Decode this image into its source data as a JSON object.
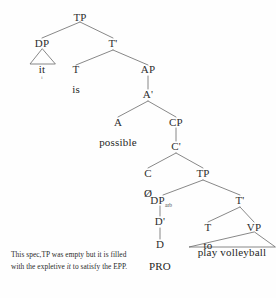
{
  "figure": {
    "type": "syntax-tree",
    "title": "",
    "line_color": "#5a5a5a",
    "text_color": "#2b2b2b",
    "background": "#fefefe"
  },
  "nodes": {
    "tp_root": "TP",
    "dp_subject": "DP",
    "t_bar_top": "T'",
    "it": "it",
    "it_subscript": "i",
    "t_head_top": "T",
    "is": "is",
    "ap": "AP",
    "a_bar": "A'",
    "a_head": "A",
    "possible": "possible",
    "cp": "CP",
    "c_bar": "C'",
    "c_head": "C",
    "null_c": "Ø",
    "tp_embedded": "TP",
    "dp_arb": "DP",
    "dp_arb_sub": "arb",
    "t_bar_low": "T'",
    "d_bar": "D'",
    "d_head": "D",
    "pro": "PRO",
    "t_head_low": "T",
    "to": "to",
    "vp": "VP",
    "play_volleyball": "play volleyball"
  },
  "caption": {
    "part1": "This spec,TP was empty but it is filled with the expletive ",
    "italic": "it",
    "part2": " to satisfy the EPP.",
    "full_text": "This spec,TP was empty but it is filled with the expletive it to satisfy the EPP."
  }
}
